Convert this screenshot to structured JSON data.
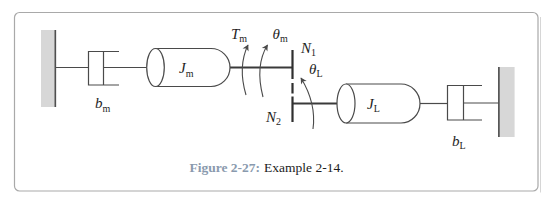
{
  "figure": {
    "caption": {
      "label": "Figure 2-27:",
      "text": "Example 2-14."
    }
  },
  "diagram": {
    "damper_motor": {
      "main": "b",
      "sub": "m"
    },
    "inertia_motor": {
      "main": "J",
      "sub": "m"
    },
    "torque_motor": {
      "main": "T",
      "sub": "m"
    },
    "angle_motor": {
      "main": "θ",
      "sub": "m"
    },
    "gear_top": {
      "main": "N",
      "sub": "1"
    },
    "gear_bottom": {
      "main": "N",
      "sub": "2"
    },
    "angle_load": {
      "main": "θ",
      "sub": "L"
    },
    "inertia_load": {
      "main": "J",
      "sub": "L"
    },
    "damper_load": {
      "main": "b",
      "sub": "L"
    }
  },
  "colors": {
    "caption_accent": "#8a9aae",
    "wall_fill": "#d7d7d7",
    "frame_border": "#a9a9a9"
  }
}
